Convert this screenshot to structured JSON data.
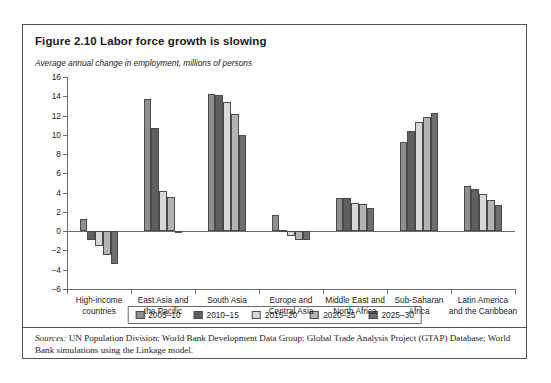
{
  "figure": {
    "title": "Figure 2.10  Labor force growth is slowing",
    "subtitle": "Average annual change in employment, millions of persons",
    "source_label": "Sources:",
    "source_text": " UN Population Division; World Bank Development Data Group; Global Trade Analysis Project (GTAP) Database; World Bank simulations using the Linkage model."
  },
  "chart_data": {
    "type": "bar",
    "title": "Figure 2.10  Labor force growth is slowing",
    "subtitle": "Average annual change in employment, millions of persons",
    "xlabel": "",
    "ylabel": "Average annual change in employment, millions of persons",
    "ylim": [
      -6,
      16
    ],
    "ytick_step": 2,
    "yticks": [
      -6,
      -4,
      -2,
      0,
      2,
      4,
      6,
      8,
      10,
      12,
      14,
      16
    ],
    "ytick_labels": [
      "−6",
      "−4",
      "−2",
      "0",
      "2",
      "4",
      "6",
      "8",
      "10",
      "12",
      "14",
      "16"
    ],
    "grid": false,
    "legend_position": "bottom",
    "categories": [
      "High-income countries",
      "East Asia and the Pacific",
      "South Asia",
      "Europe and Central Asia",
      "Middle East and North Africa",
      "Sub-Saharan Africa",
      "Latin America and the Caribbean"
    ],
    "category_lines": [
      [
        "High-income",
        "countries"
      ],
      [
        "East Asia and",
        "the Pacific"
      ],
      [
        "South Asia"
      ],
      [
        "Europe and",
        "Central Asia"
      ],
      [
        "Middle East and",
        "North Africa"
      ],
      [
        "Sub-Saharan",
        "Africa"
      ],
      [
        "Latin America",
        "and the Caribbean"
      ]
    ],
    "series": [
      {
        "name": "2005–10",
        "color": "#8f8f8f",
        "values": [
          1.3,
          13.7,
          14.2,
          1.7,
          3.4,
          9.3,
          4.7
        ]
      },
      {
        "name": "2010–15",
        "color": "#606060",
        "values": [
          -0.9,
          10.7,
          14.1,
          0.1,
          3.4,
          10.4,
          4.4
        ]
      },
      {
        "name": "2015–20",
        "color": "#d8d8d8",
        "values": [
          -1.5,
          4.2,
          13.4,
          -0.5,
          2.9,
          11.3,
          3.9
        ]
      },
      {
        "name": "2020–25",
        "color": "#b3b3b3",
        "values": [
          -2.5,
          3.5,
          12.2,
          -0.9,
          2.8,
          11.9,
          3.2
        ]
      },
      {
        "name": "2025–30",
        "color": "#6e6e6e",
        "values": [
          -3.4,
          -0.2,
          10.0,
          -0.9,
          2.4,
          12.3,
          2.7
        ]
      }
    ]
  }
}
